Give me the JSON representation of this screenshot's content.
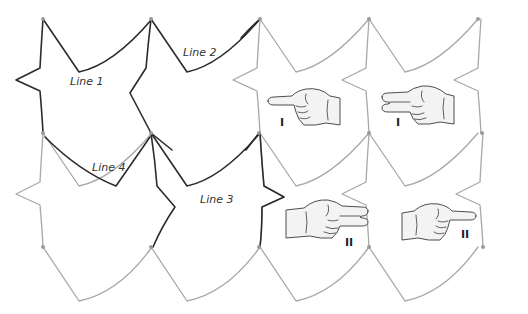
{
  "figure": {
    "labels": {
      "line1": "Line 1",
      "line2": "Line 2",
      "line3": "Line 3",
      "line4": "Line 4"
    },
    "hands": [
      {
        "id": "hand-1",
        "fingers": "one",
        "direction": "left",
        "numeral": "I"
      },
      {
        "id": "hand-2",
        "fingers": "two",
        "direction": "left",
        "numeral": "I"
      },
      {
        "id": "hand-3",
        "fingers": "two",
        "direction": "right",
        "numeral": "II"
      },
      {
        "id": "hand-4",
        "fingers": "one",
        "direction": "right",
        "numeral": "II"
      }
    ],
    "colors": {
      "dark_edge": "#2b2b2b",
      "light_edge": "#a8a8a8",
      "vertex": "#9a9a9a",
      "hand_fill": "#f3f3f3"
    }
  }
}
